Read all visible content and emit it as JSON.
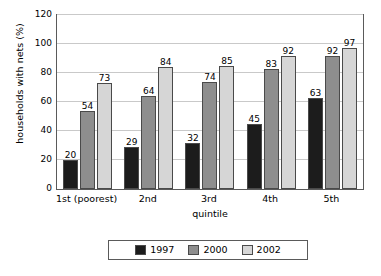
{
  "chart_data": {
    "type": "bar",
    "title": "",
    "xlabel": "quintile",
    "ylabel": "households with nets (%)",
    "categories": [
      "1st (poorest)",
      "2nd",
      "3rd",
      "4th",
      "5th"
    ],
    "series": [
      {
        "name": "1997",
        "color": "#1c1c1c",
        "values": [
          20,
          29,
          32,
          45,
          63
        ]
      },
      {
        "name": "2000",
        "color": "#8e8e8e",
        "values": [
          54,
          64,
          74,
          83,
          92
        ]
      },
      {
        "name": "2002",
        "color": "#d6d6d6",
        "values": [
          73,
          84,
          85,
          92,
          97
        ]
      }
    ],
    "ylim": [
      0,
      120
    ],
    "yticks": [
      0,
      20,
      40,
      60,
      80,
      100,
      120
    ],
    "grid": true,
    "legend_position": "bottom",
    "data_labels": true
  }
}
